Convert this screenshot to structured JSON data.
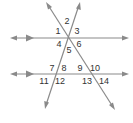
{
  "diagram": {
    "type": "parallel-lines-cut-by-transversals",
    "colors": {
      "line": "#8a8a8a",
      "label": "#333333",
      "background": "#ffffff"
    },
    "parallel_lines": [
      {
        "id": "top",
        "y": 38,
        "x1": 10,
        "x2": 129,
        "parallel_marker_x": 30
      },
      {
        "id": "bottom",
        "y": 74,
        "x1": 10,
        "x2": 129,
        "parallel_marker_x": 30
      }
    ],
    "transversals": [
      {
        "id": "rising",
        "x1": 45,
        "y1": 109,
        "x2": 80,
        "y2": 2
      },
      {
        "id": "falling",
        "x1": 46,
        "y1": 2,
        "x2": 115,
        "y2": 110
      }
    ],
    "angle_labels": [
      {
        "text": "1",
        "x": 58,
        "y": 31
      },
      {
        "text": "2",
        "x": 67,
        "y": 21
      },
      {
        "text": "3",
        "x": 77,
        "y": 31
      },
      {
        "text": "4",
        "x": 59,
        "y": 44
      },
      {
        "text": "5",
        "x": 69,
        "y": 50
      },
      {
        "text": "6",
        "x": 79,
        "y": 44
      },
      {
        "text": "7",
        "x": 52,
        "y": 68
      },
      {
        "text": "8",
        "x": 64,
        "y": 68
      },
      {
        "text": "9",
        "x": 80,
        "y": 68
      },
      {
        "text": "10",
        "x": 95,
        "y": 68
      },
      {
        "text": "11",
        "x": 44,
        "y": 81
      },
      {
        "text": "12",
        "x": 60,
        "y": 81
      },
      {
        "text": "13",
        "x": 87,
        "y": 81
      },
      {
        "text": "14",
        "x": 104,
        "y": 81
      }
    ]
  }
}
